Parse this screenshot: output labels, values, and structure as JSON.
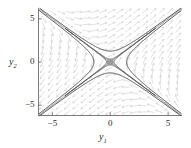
{
  "figure": {
    "name": "phase-portrait",
    "background": "#ffffff"
  },
  "chart_data": {
    "type": "scatter",
    "title": "",
    "subtitle": "",
    "xlabel": "y1",
    "ylabel": "y2",
    "xlabel_display": "y",
    "xlabel_sub": "1",
    "ylabel_display": "y",
    "ylabel_sub": "2",
    "xlim": [
      -6.2,
      6.2
    ],
    "ylim": [
      -6.2,
      6.2
    ],
    "xticks": [
      -5,
      0,
      5
    ],
    "yticks": [
      -5,
      0,
      5
    ],
    "xticklabels": [
      "−5",
      "0",
      "5"
    ],
    "yticklabels": [
      "−5",
      "0",
      "5"
    ],
    "grid": false,
    "legend": null,
    "legend_position": "none",
    "annotations": [
      {
        "name": "saddle-equilibrium-point",
        "x": 0,
        "y": 0,
        "marker": "filled-circle",
        "color": "#9a9a9a",
        "radius_px": 3.6
      }
    ],
    "vector_field": {
      "name": "direction-field",
      "color": "#c8c8c8",
      "grid_nx": 17,
      "grid_ny": 17,
      "x_range": [
        -5.8,
        5.8
      ],
      "y_range": [
        -5.8,
        5.8
      ],
      "system": "dy1/dt = y1 + 2*y2 ; dy2/dt = 2*y1 + y2",
      "arrow_length_px": 5.2
    },
    "separatrices": [
      {
        "name": "unstable-separatrix",
        "description": "straight line y2 = y1 through origin",
        "slope": 1,
        "color": "#8a8a8a",
        "width_px": 0.7
      },
      {
        "name": "stable-separatrix",
        "description": "straight line y2 = -y1 through origin",
        "slope": -1,
        "color": "#8a8a8a",
        "width_px": 0.7
      }
    ],
    "series": [
      {
        "name": "trajectory-upper-left",
        "color": "#4a4a4a",
        "width_px": 1.0,
        "branch": "hyperbola y1^2 - y2^2 = c, c = -1.6, left-opening upper arm"
      },
      {
        "name": "trajectory-lower-right",
        "color": "#4a4a4a",
        "width_px": 1.0,
        "branch": "hyperbola y1^2 - y2^2 = c, c = -1.6, right-opening lower arm"
      },
      {
        "name": "trajectory-near-separatrix-upper",
        "color": "#4a4a4a",
        "width_px": 1.0,
        "branch": "hyperbola close to unstable separatrix, c = -0.12"
      },
      {
        "name": "trajectory-near-separatrix-lower",
        "color": "#4a4a4a",
        "width_px": 1.0,
        "branch": "hyperbola close to unstable separatrix, c = 0.12"
      }
    ],
    "frame": {
      "color": "#5a5a5a",
      "width_px": 0.8,
      "sides": [
        "left",
        "bottom"
      ]
    }
  }
}
